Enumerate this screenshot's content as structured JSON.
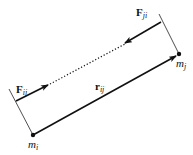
{
  "diagram": {
    "colors": {
      "stroke": "#111111",
      "background": "#ffffff"
    },
    "masses": [
      {
        "id": "m_i",
        "symbol": "m",
        "subscript": "i",
        "x": 33,
        "y": 135
      },
      {
        "id": "m_j",
        "symbol": "m",
        "subscript": "j",
        "x": 179,
        "y": 54
      }
    ],
    "vectors": [
      {
        "id": "r_ij",
        "symbol": "r",
        "subscript": "ij",
        "from": "m_i",
        "to": "m_j",
        "style": "solid"
      },
      {
        "id": "F_ij",
        "symbol": "F",
        "subscript": "ij",
        "style": "solid",
        "direction": "toward m_j"
      },
      {
        "id": "F_ji",
        "symbol": "F",
        "subscript": "ji",
        "style": "solid",
        "direction": "toward m_i"
      }
    ],
    "connector": {
      "style": "dotted",
      "between": [
        "F_ij",
        "F_ji"
      ]
    },
    "labels": {
      "F_ij": {
        "main": "F",
        "sub": "ij"
      },
      "F_ji": {
        "main": "F",
        "sub": "ji"
      },
      "r_ij": {
        "main": "r",
        "sub": "ij"
      },
      "m_i": {
        "main": "m",
        "sub": "i"
      },
      "m_j": {
        "main": "m",
        "sub": "j"
      }
    }
  }
}
